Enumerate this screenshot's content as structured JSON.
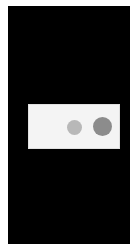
{
  "screen": {
    "background": "#000000"
  },
  "dialog": {
    "background": "#f4f4f4",
    "indicators": [
      {
        "name": "loading-dot-1",
        "color": "#b8b8b8"
      },
      {
        "name": "loading-dot-2",
        "color": "#8c8c8c"
      }
    ]
  }
}
